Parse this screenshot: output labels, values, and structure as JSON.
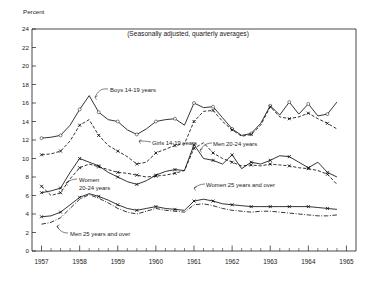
{
  "chart_data": {
    "type": "line",
    "title": "(Seasonally adjusted, quarterly averages)",
    "ylabel": "Percent",
    "xlabel": "",
    "ylim": [
      0,
      24
    ],
    "xlim": [
      1956.75,
      1965.25
    ],
    "yticks": [
      "0",
      "2",
      "4",
      "6",
      "8",
      "10",
      "12",
      "14",
      "16",
      "18",
      "20",
      "22",
      "24"
    ],
    "xticks": [
      "1957",
      "1958",
      "1959",
      "1960",
      "1961",
      "1962",
      "1963",
      "1964",
      "1965"
    ],
    "grid": false,
    "legend_position": "inline-annotations",
    "x": [
      1957.0,
      1957.25,
      1957.5,
      1957.75,
      1958.0,
      1958.25,
      1958.5,
      1958.75,
      1959.0,
      1959.25,
      1959.5,
      1959.75,
      1960.0,
      1960.25,
      1960.5,
      1960.75,
      1961.0,
      1961.25,
      1961.5,
      1961.75,
      1962.0,
      1962.25,
      1962.5,
      1962.75,
      1963.0,
      1963.25,
      1963.5,
      1963.75,
      1964.0,
      1964.25,
      1964.5,
      1964.75
    ],
    "series": [
      {
        "name": "Boys 14-19 years",
        "style": "solid-circles",
        "values": [
          12.2,
          12.3,
          12.5,
          13.6,
          15.3,
          16.8,
          15.0,
          14.2,
          14.0,
          13.1,
          12.6,
          13.2,
          14.0,
          14.2,
          14.3,
          13.6,
          16.0,
          15.5,
          15.6,
          14.4,
          13.2,
          12.5,
          12.7,
          13.8,
          15.7,
          14.7,
          16.1,
          14.8,
          15.9,
          14.6,
          14.8,
          16.1
        ]
      },
      {
        "name": "Girls 14-19 years",
        "style": "dashed-crosses",
        "values": [
          10.4,
          10.5,
          10.8,
          11.9,
          13.6,
          14.2,
          12.5,
          11.4,
          10.8,
          10.2,
          9.4,
          9.6,
          10.6,
          11.0,
          11.4,
          11.6,
          14.0,
          15.1,
          15.2,
          14.0,
          13.1,
          12.4,
          12.6,
          13.6,
          15.6,
          14.5,
          14.3,
          14.5,
          14.9,
          14.3,
          13.8,
          13.2
        ]
      },
      {
        "name": "Men 20-24 years",
        "style": "solid-crosses",
        "values": [
          6.3,
          6.5,
          6.8,
          8.5,
          10.0,
          9.6,
          9.2,
          8.5,
          8.0,
          7.5,
          7.2,
          7.6,
          8.2,
          8.6,
          8.8,
          8.7,
          11.5,
          10.0,
          9.8,
          9.4,
          10.4,
          8.9,
          9.6,
          9.4,
          9.8,
          10.3,
          10.2,
          9.6,
          9.0,
          9.6,
          8.5,
          8.0
        ]
      },
      {
        "name": "Women 20-24 years",
        "style": "dashed-crosses",
        "values": [
          7.0,
          6.0,
          6.3,
          7.8,
          9.0,
          9.4,
          9.1,
          8.8,
          8.5,
          8.4,
          8.2,
          8.0,
          8.1,
          8.2,
          8.4,
          8.7,
          11.1,
          11.7,
          10.6,
          10.0,
          9.6,
          9.2,
          9.3,
          9.2,
          9.4,
          9.3,
          9.2,
          9.0,
          8.9,
          8.7,
          8.3,
          7.2
        ]
      },
      {
        "name": "Women 25 years and over",
        "style": "solid-crosses",
        "values": [
          3.7,
          3.8,
          4.2,
          5.0,
          5.8,
          6.2,
          5.9,
          5.5,
          5.0,
          4.6,
          4.4,
          4.6,
          4.8,
          4.6,
          4.5,
          4.4,
          5.4,
          5.6,
          5.4,
          5.1,
          5.0,
          4.9,
          4.8,
          4.8,
          4.8,
          4.8,
          4.8,
          4.8,
          4.8,
          4.7,
          4.6,
          4.5
        ]
      },
      {
        "name": "Men 25 years and over",
        "style": "dashdot",
        "values": [
          2.9,
          3.1,
          3.6,
          4.6,
          5.6,
          6.1,
          5.7,
          5.2,
          4.6,
          4.2,
          4.0,
          4.3,
          4.6,
          4.4,
          4.3,
          4.2,
          5.0,
          5.1,
          4.9,
          4.6,
          4.4,
          4.3,
          4.2,
          4.3,
          4.3,
          4.2,
          4.1,
          4.0,
          3.9,
          3.8,
          3.8,
          3.9
        ]
      }
    ],
    "annotations": [
      {
        "label": "Boys 14-19 years"
      },
      {
        "label": "Girls 14-19 years"
      },
      {
        "label": "Men 20-24 years"
      },
      {
        "label": "Women"
      },
      {
        "label": "20-24 years"
      },
      {
        "label": "Women 25 years and over"
      },
      {
        "label": "Men 25 years and over"
      }
    ]
  }
}
